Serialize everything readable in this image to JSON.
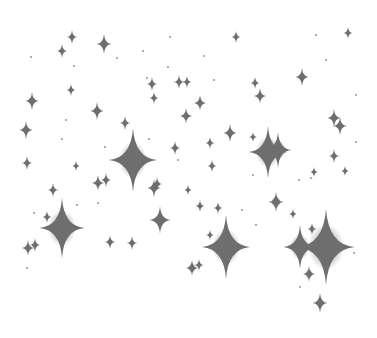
{
  "image": {
    "width": 377,
    "height": 338,
    "background": "#ffffff",
    "sparkle_color": "#6e6e6e",
    "description": "Scattered gray four-pointed sparkle stars on white background"
  },
  "sparkles": [
    {
      "x": 72,
      "y": 37,
      "r": 7,
      "glow": 0
    },
    {
      "x": 62,
      "y": 51,
      "r": 7,
      "glow": 0
    },
    {
      "x": 104,
      "y": 44,
      "r": 10,
      "glow": 0
    },
    {
      "x": 236,
      "y": 37,
      "r": 6,
      "glow": 0
    },
    {
      "x": 348,
      "y": 33,
      "r": 6,
      "glow": 0
    },
    {
      "x": 302,
      "y": 77,
      "r": 9,
      "glow": 2
    },
    {
      "x": 71,
      "y": 90,
      "r": 6,
      "glow": 0
    },
    {
      "x": 32,
      "y": 101,
      "r": 9,
      "glow": 3
    },
    {
      "x": 152,
      "y": 84,
      "r": 7,
      "glow": 0
    },
    {
      "x": 154,
      "y": 98,
      "r": 6,
      "glow": 0
    },
    {
      "x": 179,
      "y": 82,
      "r": 7,
      "glow": 0
    },
    {
      "x": 187,
      "y": 82,
      "r": 6,
      "glow": 0
    },
    {
      "x": 255,
      "y": 83,
      "r": 6,
      "glow": 0
    },
    {
      "x": 260,
      "y": 96,
      "r": 8,
      "glow": 0
    },
    {
      "x": 97,
      "y": 111,
      "r": 9,
      "glow": 3
    },
    {
      "x": 200,
      "y": 103,
      "r": 8,
      "glow": 2
    },
    {
      "x": 186,
      "y": 116,
      "r": 8,
      "glow": 3
    },
    {
      "x": 125,
      "y": 123,
      "r": 7,
      "glow": 0
    },
    {
      "x": 26,
      "y": 130,
      "r": 9,
      "glow": 0
    },
    {
      "x": 230,
      "y": 133,
      "r": 9,
      "glow": 3
    },
    {
      "x": 334,
      "y": 118,
      "r": 9,
      "glow": 3
    },
    {
      "x": 340,
      "y": 126,
      "r": 9,
      "glow": 3
    },
    {
      "x": 133,
      "y": 160,
      "r": 32,
      "glow": 14
    },
    {
      "x": 268,
      "y": 152,
      "r": 26,
      "glow": 12
    },
    {
      "x": 278,
      "y": 150,
      "r": 18,
      "glow": 8
    },
    {
      "x": 175,
      "y": 148,
      "r": 7,
      "glow": 0
    },
    {
      "x": 210,
      "y": 143,
      "r": 6,
      "glow": 0
    },
    {
      "x": 253,
      "y": 137,
      "r": 5,
      "glow": 0
    },
    {
      "x": 27,
      "y": 163,
      "r": 7,
      "glow": 0
    },
    {
      "x": 76,
      "y": 166,
      "r": 5,
      "glow": 0
    },
    {
      "x": 334,
      "y": 156,
      "r": 7,
      "glow": 0
    },
    {
      "x": 345,
      "y": 171,
      "r": 5,
      "glow": 0
    },
    {
      "x": 212,
      "y": 166,
      "r": 6,
      "glow": 0
    },
    {
      "x": 98,
      "y": 183,
      "r": 8,
      "glow": 3
    },
    {
      "x": 106,
      "y": 180,
      "r": 7,
      "glow": 0
    },
    {
      "x": 154,
      "y": 188,
      "r": 9,
      "glow": 3
    },
    {
      "x": 157,
      "y": 184,
      "r": 7,
      "glow": 0
    },
    {
      "x": 53,
      "y": 190,
      "r": 7,
      "glow": 0
    },
    {
      "x": 47,
      "y": 217,
      "r": 6,
      "glow": 0
    },
    {
      "x": 188,
      "y": 190,
      "r": 5,
      "glow": 0
    },
    {
      "x": 160,
      "y": 220,
      "r": 14,
      "glow": 4
    },
    {
      "x": 276,
      "y": 202,
      "r": 10,
      "glow": 5
    },
    {
      "x": 293,
      "y": 214,
      "r": 5,
      "glow": 0
    },
    {
      "x": 200,
      "y": 206,
      "r": 6,
      "glow": 0
    },
    {
      "x": 218,
      "y": 208,
      "r": 6,
      "glow": 0
    },
    {
      "x": 210,
      "y": 235,
      "r": 5,
      "glow": 0
    },
    {
      "x": 314,
      "y": 172,
      "r": 5,
      "glow": 0
    },
    {
      "x": 62,
      "y": 228,
      "r": 30,
      "glow": 14
    },
    {
      "x": 28,
      "y": 248,
      "r": 8,
      "glow": 3
    },
    {
      "x": 35,
      "y": 245,
      "r": 7,
      "glow": 0
    },
    {
      "x": 110,
      "y": 242,
      "r": 7,
      "glow": 0
    },
    {
      "x": 132,
      "y": 243,
      "r": 7,
      "glow": 0
    },
    {
      "x": 226,
      "y": 247,
      "r": 32,
      "glow": 14
    },
    {
      "x": 326,
      "y": 247,
      "r": 38,
      "glow": 18
    },
    {
      "x": 300,
      "y": 247,
      "r": 22,
      "glow": 10
    },
    {
      "x": 312,
      "y": 229,
      "r": 6,
      "glow": 0
    },
    {
      "x": 309,
      "y": 274,
      "r": 8,
      "glow": 4
    },
    {
      "x": 320,
      "y": 303,
      "r": 10,
      "glow": 3
    },
    {
      "x": 192,
      "y": 268,
      "r": 8,
      "glow": 4
    },
    {
      "x": 199,
      "y": 265,
      "r": 6,
      "glow": 0
    }
  ],
  "dots": [
    {
      "x": 31,
      "y": 57
    },
    {
      "x": 117,
      "y": 58
    },
    {
      "x": 74,
      "y": 66
    },
    {
      "x": 143,
      "y": 51
    },
    {
      "x": 170,
      "y": 37
    },
    {
      "x": 168,
      "y": 67
    },
    {
      "x": 147,
      "y": 78
    },
    {
      "x": 66,
      "y": 120
    },
    {
      "x": 62,
      "y": 139
    },
    {
      "x": 105,
      "y": 147
    },
    {
      "x": 149,
      "y": 139
    },
    {
      "x": 178,
      "y": 160
    },
    {
      "x": 204,
      "y": 56
    },
    {
      "x": 214,
      "y": 80
    },
    {
      "x": 316,
      "y": 35
    },
    {
      "x": 326,
      "y": 60
    },
    {
      "x": 356,
      "y": 95
    },
    {
      "x": 356,
      "y": 142
    },
    {
      "x": 34,
      "y": 213
    },
    {
      "x": 77,
      "y": 205
    },
    {
      "x": 98,
      "y": 203
    },
    {
      "x": 27,
      "y": 268
    },
    {
      "x": 253,
      "y": 175
    },
    {
      "x": 299,
      "y": 180
    },
    {
      "x": 311,
      "y": 178
    },
    {
      "x": 242,
      "y": 210
    },
    {
      "x": 256,
      "y": 225
    },
    {
      "x": 300,
      "y": 287
    },
    {
      "x": 354,
      "y": 253
    }
  ]
}
